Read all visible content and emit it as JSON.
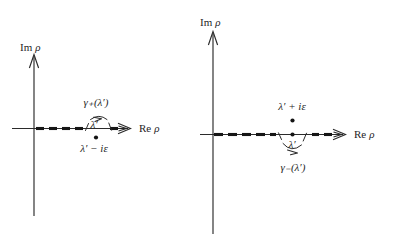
{
  "figure": {
    "background_color": "#ffffff",
    "ink_color": "#1f1f1f",
    "cut_color": "#161616"
  },
  "panels": [
    {
      "id": "left",
      "axis_imaginary_label": "Im",
      "axis_imaginary_variable": "ρ",
      "axis_real_label": "Re",
      "axis_real_variable": "ρ",
      "contour_label_base": "γ",
      "contour_label_sign": "+",
      "contour_label_arg": "(λ′)",
      "contour_label_full": "γ₊(λ′)",
      "contour_side": "above-axis",
      "contour_direction": "rightward",
      "pole_label": "λ′ − iε",
      "pole_position": "below-axis",
      "on_axis_label": "λ′",
      "branch_cut": "dashed-real-axis"
    },
    {
      "id": "right",
      "axis_imaginary_label": "Im",
      "axis_imaginary_variable": "ρ",
      "axis_real_label": "Re",
      "axis_real_variable": "ρ",
      "contour_label_base": "γ",
      "contour_label_sign": "−",
      "contour_label_arg": "(λ′)",
      "contour_label_full": "γ₋(λ′)",
      "contour_side": "below-axis",
      "contour_direction": "rightward",
      "pole_label": "λ′ + iε",
      "pole_position": "above-axis",
      "on_axis_label": "λ′",
      "branch_cut": "dashed-real-axis"
    }
  ]
}
